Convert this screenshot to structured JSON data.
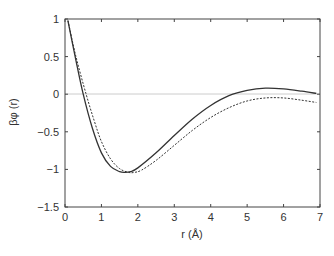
{
  "chart_data": {
    "type": "line",
    "title": "",
    "xlabel": "r (Å)",
    "ylabel": "βφ (r)",
    "xlim": [
      0,
      7
    ],
    "ylim": [
      -1.5,
      1
    ],
    "xticks": [
      "0",
      "1",
      "2",
      "3",
      "4",
      "5",
      "6",
      "7"
    ],
    "yticks": [
      "1",
      "0.5",
      "0",
      "−0.5",
      "−1",
      "−1.5"
    ],
    "grid": false,
    "reference_line": {
      "y": 0,
      "color": "#cccccc"
    },
    "legend": null,
    "series": [
      {
        "name": "solid",
        "style": "solid",
        "x": [
          0.08,
          0.3,
          0.5,
          0.75,
          1.0,
          1.25,
          1.5,
          1.65,
          1.8,
          2.0,
          2.5,
          3.0,
          3.5,
          4.0,
          4.5,
          5.0,
          5.5,
          6.0,
          6.5,
          6.9
        ],
        "y": [
          0.98,
          0.45,
          0.0,
          -0.45,
          -0.78,
          -0.96,
          -1.03,
          -1.04,
          -1.03,
          -0.98,
          -0.78,
          -0.55,
          -0.33,
          -0.15,
          -0.02,
          0.05,
          0.08,
          0.07,
          0.04,
          0.01
        ]
      },
      {
        "name": "dashed",
        "style": "dashed",
        "x": [
          0.08,
          0.3,
          0.58,
          0.8,
          1.0,
          1.25,
          1.5,
          1.75,
          1.9,
          2.1,
          2.5,
          3.0,
          3.5,
          4.0,
          4.5,
          5.0,
          5.5,
          6.0,
          6.5,
          6.9
        ],
        "y": [
          0.98,
          0.5,
          0.0,
          -0.35,
          -0.63,
          -0.86,
          -0.99,
          -1.04,
          -1.04,
          -1.01,
          -0.88,
          -0.68,
          -0.48,
          -0.31,
          -0.18,
          -0.09,
          -0.05,
          -0.05,
          -0.08,
          -0.11
        ]
      }
    ]
  }
}
